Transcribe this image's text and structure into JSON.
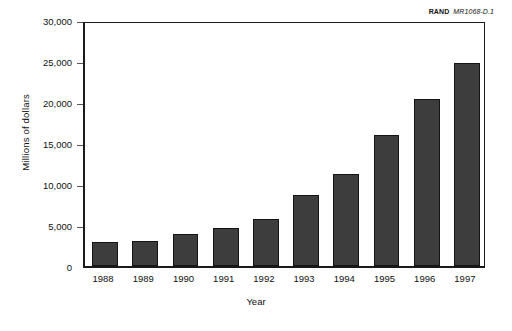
{
  "credit": {
    "org": "RAND",
    "id": "MR1068-D.1"
  },
  "chart_data": {
    "type": "bar",
    "title": "",
    "subtitle": "",
    "xlabel": "Year",
    "ylabel": "Millions of dollars",
    "categories": [
      "1988",
      "1989",
      "1990",
      "1991",
      "1992",
      "1993",
      "1994",
      "1995",
      "1996",
      "1997"
    ],
    "values": [
      2950,
      3100,
      3900,
      4600,
      5700,
      8600,
      11200,
      16000,
      20400,
      24700
    ],
    "ylim": [
      0,
      30000
    ],
    "yticks": [
      0,
      5000,
      10000,
      15000,
      20000,
      25000,
      30000
    ],
    "ytick_labels": [
      "0",
      "5,000",
      "10,000",
      "15,000",
      "20,000",
      "25,000",
      "30,000"
    ],
    "grid": false,
    "legend": "none",
    "bar_color": "#3d3d3d",
    "bar_edge_color": "#141414",
    "axis_color": "#1a1a1a"
  }
}
